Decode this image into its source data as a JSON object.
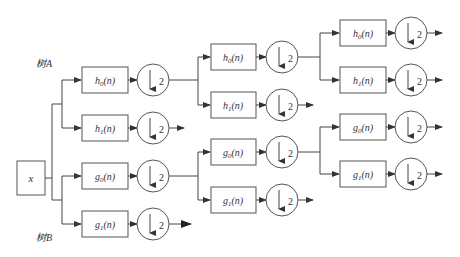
{
  "diagram": {
    "type": "dual-tree filter bank",
    "input_label": "x",
    "tree_labels": {
      "a": "树A",
      "b": "树B"
    },
    "downsample_label": "2",
    "level1": [
      {
        "id": "A-h0",
        "filter": "h0(n)"
      },
      {
        "id": "A-h1",
        "filter": "h1(n)"
      },
      {
        "id": "B-g0",
        "filter": "g0(n)"
      },
      {
        "id": "B-g1",
        "filter": "g1(n)"
      }
    ],
    "level2": [
      {
        "id": "A-h0-h0",
        "filter": "h0(n)"
      },
      {
        "id": "A-h0-h1",
        "filter": "h1(n)"
      },
      {
        "id": "B-g0-g0",
        "filter": "g0(n)"
      },
      {
        "id": "B-g0-g1",
        "filter": "g1(n)"
      }
    ],
    "level3": [
      {
        "id": "A-h0-h0-h0",
        "filter": "h0(n)"
      },
      {
        "id": "A-h0-h0-h1",
        "filter": "h1(n)"
      },
      {
        "id": "B-g0-g0-g0",
        "filter": "g0(n)"
      },
      {
        "id": "B-g0-g0-g1",
        "filter": "g1(n)"
      }
    ]
  },
  "caption": ""
}
